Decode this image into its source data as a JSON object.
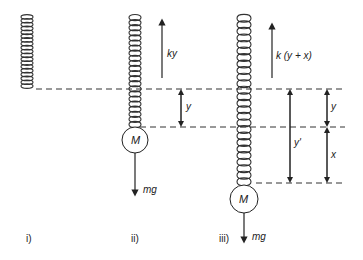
{
  "diagram": {
    "type": "spring-mass system",
    "panels": [
      {
        "id": "i",
        "label": "i)"
      },
      {
        "id": "ii",
        "label": "ii)",
        "mass_label": "M",
        "force_up": "ky",
        "force_down": "mg",
        "displacement": "y"
      },
      {
        "id": "iii",
        "label": "iii)",
        "mass_label": "M",
        "force_up": "k (y + x)",
        "force_down": "mg",
        "displacements": [
          "y",
          "x",
          "y'"
        ]
      }
    ],
    "colors": {
      "line": "#222222",
      "background": "#ffffff"
    }
  }
}
